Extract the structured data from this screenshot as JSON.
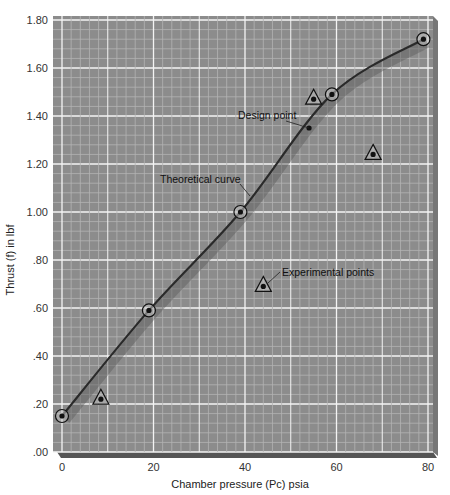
{
  "chart_data": {
    "type": "scatter",
    "title": "",
    "xlabel": "Chamber pressure (Pc) psia",
    "ylabel": "Thrust (f) in lbf",
    "xlim": [
      0,
      80
    ],
    "ylim": [
      0,
      1.8
    ],
    "x_ticks": [
      0,
      20,
      40,
      60,
      80
    ],
    "x_tick_labels": [
      "0",
      "20",
      "40",
      "60",
      "80"
    ],
    "y_ticks": [
      0,
      0.2,
      0.4,
      0.6,
      0.8,
      1.0,
      1.2,
      1.4,
      1.6,
      1.8
    ],
    "y_tick_labels": [
      ".00",
      ".20",
      ".40",
      ".60",
      ".80",
      "1.00",
      "1.20",
      "1.40",
      "1.60",
      "1.80"
    ],
    "grid": true,
    "legend": null,
    "series": [
      {
        "name": "Theoretical curve",
        "kind": "line",
        "marker": "circle",
        "points": [
          {
            "x": 0,
            "y": 0.15
          },
          {
            "x": 19,
            "y": 0.59
          },
          {
            "x": 39,
            "y": 1.0
          },
          {
            "x": 59,
            "y": 1.49
          },
          {
            "x": 79,
            "y": 1.72
          }
        ]
      },
      {
        "name": "Experimental points",
        "kind": "scatter",
        "marker": "triangle",
        "points": [
          {
            "x": 8.5,
            "y": 0.22
          },
          {
            "x": 44,
            "y": 0.69
          },
          {
            "x": 55,
            "y": 1.47
          },
          {
            "x": 68,
            "y": 1.24
          }
        ]
      },
      {
        "name": "Design point",
        "kind": "scatter",
        "marker": "dot",
        "points": [
          {
            "x": 54,
            "y": 1.35
          }
        ]
      }
    ],
    "annotations": [
      {
        "text": "Design point",
        "x": 54,
        "y": 1.35
      },
      {
        "text": "Theoretical curve",
        "x": 43,
        "y": 1.15
      },
      {
        "text": "Experimental points",
        "x": 45,
        "y": 0.7
      }
    ]
  },
  "colors": {
    "plot_background": "#8c8c8c",
    "minor_grid": "#b4b4b4",
    "major_grid": "#f4f4f4",
    "curve": "#2a2a2a",
    "marker": "#111111"
  }
}
